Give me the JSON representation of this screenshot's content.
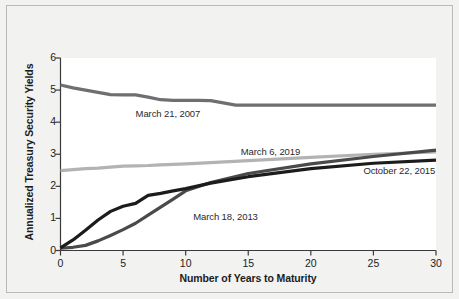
{
  "chart_data": {
    "type": "line",
    "title": "",
    "subtitle": "",
    "xlabel": "Number of Years to Maturity",
    "ylabel": "Annualized Treasury Security Yields",
    "xlim": [
      0,
      30
    ],
    "ylim": [
      0,
      6
    ],
    "xticks": [
      "0",
      "5",
      "10",
      "15",
      "20",
      "25",
      "30"
    ],
    "yticks": [
      "0",
      "1",
      "2",
      "3",
      "4",
      "5",
      "6"
    ],
    "grid": false,
    "legend_position": "inline-annotations",
    "series": [
      {
        "name": "March 21, 2007",
        "color": "#6f6f6f",
        "label_x": 6,
        "label_y": 4.27,
        "x": [
          0,
          1,
          2,
          3,
          4,
          5,
          6,
          7,
          8,
          9,
          10,
          11,
          12,
          13,
          14,
          15,
          20,
          25,
          30
        ],
        "values": [
          5.16,
          5.07,
          5.0,
          4.93,
          4.86,
          4.85,
          4.85,
          4.78,
          4.7,
          4.68,
          4.68,
          4.68,
          4.67,
          4.6,
          4.53,
          4.53,
          4.53,
          4.53,
          4.53
        ]
      },
      {
        "name": "March 6, 2019",
        "color": "#b3b3b3",
        "label_x": 14.4,
        "label_y": 3.07,
        "x": [
          0,
          1,
          2,
          3,
          4,
          5,
          6,
          7,
          8,
          10,
          12,
          15,
          20,
          25,
          30
        ],
        "values": [
          2.49,
          2.52,
          2.55,
          2.57,
          2.6,
          2.63,
          2.64,
          2.65,
          2.67,
          2.7,
          2.74,
          2.8,
          2.9,
          3.0,
          3.07
        ]
      },
      {
        "name": "October 22, 2015",
        "color": "#1c1c1c",
        "label_x": 24.2,
        "label_y": 2.47,
        "x": [
          0,
          1,
          2,
          3,
          4,
          5,
          6,
          7,
          8,
          9,
          10,
          12,
          15,
          20,
          25,
          30
        ],
        "values": [
          0.08,
          0.33,
          0.63,
          0.95,
          1.22,
          1.38,
          1.47,
          1.72,
          1.78,
          1.86,
          1.93,
          2.1,
          2.3,
          2.55,
          2.72,
          2.82
        ]
      },
      {
        "name": "March 18, 2013",
        "color": "#4a4a4a",
        "label_x": 10.6,
        "label_y": 1.03,
        "x": [
          0,
          1,
          2,
          3,
          4,
          5,
          6,
          7,
          8,
          9,
          10,
          12,
          15,
          20,
          25,
          30
        ],
        "values": [
          0.07,
          0.1,
          0.16,
          0.3,
          0.47,
          0.65,
          0.85,
          1.1,
          1.35,
          1.6,
          1.86,
          2.12,
          2.4,
          2.7,
          2.93,
          3.13
        ]
      }
    ]
  },
  "axes": {
    "x_title": "Number of Years to Maturity",
    "y_title": "Annualized Treasury Security Yields"
  },
  "colors": {
    "background": "#f2f2f1",
    "plot_background": "#ffffff",
    "axis": "#3a3a3a",
    "border": "#b9b9b7"
  }
}
